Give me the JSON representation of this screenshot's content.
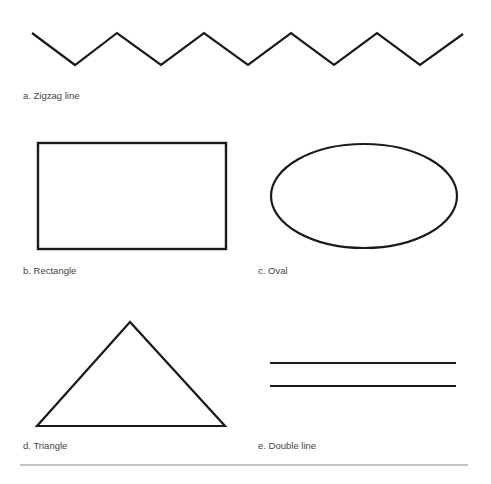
{
  "figure": {
    "stroke_color": "#1a1a1a",
    "rule_color": "#8a8a8a",
    "shapes": [
      {
        "id": "a",
        "label": "a. Zigzag line",
        "type": "zigzag",
        "points": [
          [
            32,
            33
          ],
          [
            75,
            65
          ],
          [
            117,
            33
          ],
          [
            161,
            65
          ],
          [
            204,
            33
          ],
          [
            248,
            65
          ],
          [
            291,
            33
          ],
          [
            334,
            65
          ],
          [
            377,
            33
          ],
          [
            420,
            65
          ],
          [
            463,
            34
          ]
        ]
      },
      {
        "id": "b",
        "label": "b. Rectangle",
        "type": "rectangle",
        "x": 38,
        "y": 143,
        "width": 188,
        "height": 106
      },
      {
        "id": "c",
        "label": "c. Oval",
        "type": "ellipse",
        "cx": 364,
        "cy": 196,
        "rx": 93,
        "ry": 52
      },
      {
        "id": "d",
        "label": "d. Triangle",
        "type": "triangle",
        "points": [
          [
            130,
            322
          ],
          [
            37,
            426
          ],
          [
            225,
            426
          ]
        ]
      },
      {
        "id": "e",
        "label": "e. Double line",
        "type": "double_line",
        "x1": 270,
        "x2": 456,
        "y_values": [
          363,
          386
        ]
      }
    ]
  }
}
